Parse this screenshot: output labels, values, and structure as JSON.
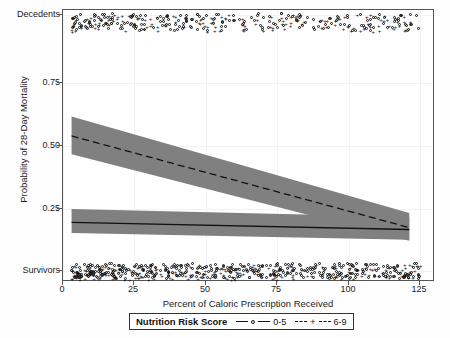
{
  "chart_data": {
    "type": "line",
    "title": "",
    "xlabel": "Percent of Caloric Prescription Received",
    "ylabel": "Probability of 28-Day Mortality",
    "xlim": [
      -3,
      127
    ],
    "ylim": [
      0.0,
      1.0
    ],
    "xticks": [
      0,
      25,
      50,
      75,
      100,
      125
    ],
    "xtick_labels": [
      "0",
      "25",
      "50",
      "75",
      "100",
      "125"
    ],
    "yticks": [
      0.0,
      0.25,
      0.5,
      0.75,
      1.0
    ],
    "ytick_labels": [
      "Survivors",
      "0.25",
      "0.50",
      "0.75",
      "Decedents"
    ],
    "grid": true,
    "legend_position": "below-axis",
    "legend_title": "Nutrition Risk Score",
    "series": [
      {
        "name": "0-5",
        "marker": "circle",
        "linestyle": "solid",
        "color": "#111111",
        "band_color": "#808080",
        "x": [
          0,
          118
        ],
        "y": [
          0.219,
          0.193
        ],
        "ci_lower": [
          0.18,
          0.155
        ],
        "ci_upper": [
          0.268,
          0.239
        ]
      },
      {
        "name": "6-9",
        "marker": "plus",
        "linestyle": "dashed",
        "color": "#111111",
        "band_color": "#808080",
        "x": [
          0,
          118
        ],
        "y": [
          0.537,
          0.2
        ],
        "ci_lower": [
          0.47,
          0.152
        ],
        "ci_upper": [
          0.608,
          0.254
        ]
      }
    ],
    "rug_rows": [
      {
        "name": "Decedents",
        "y": 1.0
      },
      {
        "name": "Survivors",
        "y": 0.0
      }
    ]
  },
  "axis": {
    "y_top_label": "Decedents",
    "y_bottom_label": "Survivors",
    "y_075": "0.75",
    "y_050": "0.50",
    "y_025": "0.25",
    "x_0": "0",
    "x_25": "25",
    "x_50": "50",
    "x_75": "75",
    "x_100": "100",
    "x_125": "125",
    "x_title": "Percent of Caloric Prescription Received",
    "y_title": "Probability of 28-Day Mortality"
  },
  "legend": {
    "title": "Nutrition Risk Score",
    "entries": [
      {
        "label": "0-5",
        "marker": "circle-marker-icon"
      },
      {
        "label": "6-9",
        "marker": "plus-marker-icon"
      }
    ]
  }
}
